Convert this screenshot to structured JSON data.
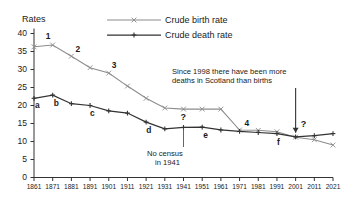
{
  "axis_label": "Rates",
  "legend": {
    "birth_label": "Crude birth rate",
    "death_label": "Crude death rate",
    "birth_color": "#8c8c8c",
    "death_color": "#333333",
    "birth_marker": "x-marker-icon",
    "death_marker": "plus-marker-icon"
  },
  "annotations": {
    "deaths_line1": "Since 1998 there have been more",
    "deaths_line2": "deaths in Scotland than births",
    "census_line1": "No census",
    "census_line2": "in 1941",
    "arrow": "down-arrow-icon",
    "question_mark_census": "?",
    "question_mark_crossover": "?"
  },
  "point_labels_birth": [
    "1",
    "2",
    "3",
    "4"
  ],
  "point_labels_death": [
    "a",
    "b",
    "c",
    "d",
    "e",
    "f"
  ],
  "chart_data": {
    "type": "line",
    "title": "",
    "xlabel": "",
    "ylabel": "Rates",
    "xlim": [
      1861,
      2021
    ],
    "ylim": [
      0,
      40
    ],
    "yticks": [
      0,
      5,
      10,
      15,
      20,
      25,
      30,
      35,
      40
    ],
    "xticks": [
      1861,
      1871,
      1881,
      1891,
      1901,
      1911,
      1921,
      1931,
      1941,
      1951,
      1961,
      1971,
      1981,
      1991,
      2001,
      2011,
      2021
    ],
    "grid": false,
    "legend_position": "top-center",
    "x": [
      1861,
      1871,
      1881,
      1891,
      1901,
      1911,
      1921,
      1931,
      1941,
      1951,
      1961,
      1971,
      1981,
      1991,
      2001,
      2011,
      2021
    ],
    "series": [
      {
        "name": "Crude birth rate",
        "marker": "x",
        "color": "#8c8c8c",
        "values": [
          36.3,
          36.8,
          33.7,
          30.5,
          29.0,
          25.4,
          22.0,
          19.3,
          19.0,
          19.0,
          19.0,
          13.2,
          13.1,
          12.7,
          11.2,
          10.5,
          9.0
        ]
      },
      {
        "name": "Crude death rate",
        "marker": "+",
        "color": "#333333",
        "values": [
          22.0,
          22.9,
          20.5,
          20.0,
          18.5,
          17.9,
          15.4,
          13.5,
          13.9,
          14.0,
          13.2,
          12.8,
          12.5,
          12.2,
          11.3,
          11.6,
          12.2
        ]
      }
    ],
    "annotated_points_birth": [
      {
        "label": "1",
        "x": 1871,
        "y": 36.8
      },
      {
        "label": "2",
        "x": 1881,
        "y": 33.7
      },
      {
        "label": "3",
        "x": 1901,
        "y": 29.0
      },
      {
        "label": "4",
        "x": 1971,
        "y": 13.2
      }
    ],
    "annotated_points_death": [
      {
        "label": "a",
        "x": 1861,
        "y": 22.0
      },
      {
        "label": "b",
        "x": 1871,
        "y": 22.9
      },
      {
        "label": "c",
        "x": 1891,
        "y": 20.0
      },
      {
        "label": "d",
        "x": 1921,
        "y": 15.4
      },
      {
        "label": "e",
        "x": 1951,
        "y": 14.0
      },
      {
        "label": "f",
        "x": 1991,
        "y": 12.2
      }
    ],
    "annotations": [
      {
        "text": "Since 1998 there have been more deaths in Scotland than births",
        "points_to_x": 2001
      },
      {
        "text": "No census in 1941",
        "points_to_x": 1941
      }
    ]
  }
}
